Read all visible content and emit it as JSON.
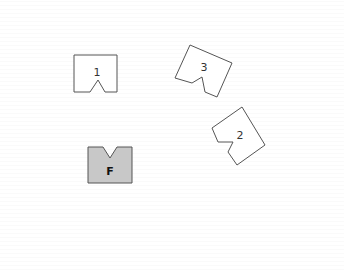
{
  "diagram": {
    "shapes": [
      {
        "id": "shape-1",
        "label": "1",
        "fill": "#ffffff",
        "stroke": "#555555",
        "points": "74,55 117,55 117,92 105,92 98,80 90,92 74,92",
        "label_pos": [
          97,
          76
        ]
      },
      {
        "id": "shape-3",
        "label": "3",
        "fill": "#ffffff",
        "stroke": "#555555",
        "points": "190,45 232,63 217,97 205,92 202,77 192,83 175,78",
        "label_pos": [
          204,
          71
        ]
      },
      {
        "id": "shape-2",
        "label": "2",
        "fill": "#ffffff",
        "stroke": "#555555",
        "points": "242,107 265,145 237,165 228,152 233,142 218,142 212,128",
        "label_pos": [
          240,
          139
        ]
      },
      {
        "id": "shape-F",
        "label": "F",
        "fill": "#c8c8c8",
        "stroke": "#555555",
        "points": "88,147 103,147 110,158 117,147 132,147 132,183 88,183",
        "label_pos": [
          110,
          175
        ]
      }
    ]
  }
}
